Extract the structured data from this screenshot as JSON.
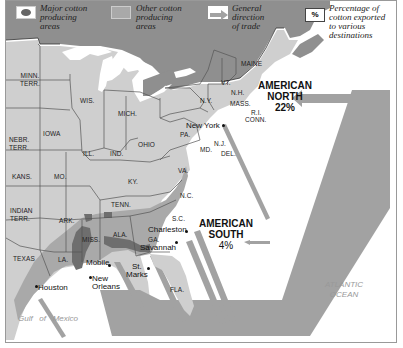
{
  "legend": {
    "major": {
      "icon": "major-cotton-swatch",
      "label_lines": [
        "Major cotton",
        "producing",
        "areas"
      ]
    },
    "other": {
      "icon": "other-cotton-swatch",
      "label_lines": [
        "Other cotton",
        "producing",
        "areas"
      ]
    },
    "trade": {
      "icon": "arrow-right-icon",
      "label_lines": [
        "General",
        "direction",
        "of trade"
      ]
    },
    "percent": {
      "icon_text": "%",
      "label_lines": [
        "Percentage of",
        "cotton exported",
        "to various",
        "destinations"
      ]
    }
  },
  "colors": {
    "canada": "#8f8f8f",
    "states": "#cfcfcf",
    "other_cotton": "#a9a9a9",
    "major_cotton": "#6e6e6e",
    "trade_band": "#a2a2a2",
    "water": "#ffffff",
    "borders": "#555555"
  },
  "states": [
    {
      "name": "MINN.",
      "name2": "TERR."
    },
    {
      "name": "WIS."
    },
    {
      "name": "MICH."
    },
    {
      "name": "IOWA"
    },
    {
      "name": "NEBR.",
      "name2": "TERR."
    },
    {
      "name": "ILL."
    },
    {
      "name": "IND."
    },
    {
      "name": "OHIO"
    },
    {
      "name": "PA."
    },
    {
      "name": "N.Y."
    },
    {
      "name": "VT."
    },
    {
      "name": "N.H."
    },
    {
      "name": "MAINE"
    },
    {
      "name": "MASS."
    },
    {
      "name": "R.I."
    },
    {
      "name": "CONN."
    },
    {
      "name": "N.J."
    },
    {
      "name": "MD."
    },
    {
      "name": "DEL."
    },
    {
      "name": "KANS."
    },
    {
      "name": "MO."
    },
    {
      "name": "KY."
    },
    {
      "name": "VA."
    },
    {
      "name": "INDIAN",
      "name2": "TERR."
    },
    {
      "name": "TENN."
    },
    {
      "name": "N.C."
    },
    {
      "name": "ARK."
    },
    {
      "name": "S.C."
    },
    {
      "name": "MISS."
    },
    {
      "name": "ALA."
    },
    {
      "name": "GA."
    },
    {
      "name": "TEXAS"
    },
    {
      "name": "LA."
    },
    {
      "name": "FLA."
    }
  ],
  "cities": [
    {
      "name": "New York"
    },
    {
      "name": "Charleston"
    },
    {
      "name": "Savannah"
    },
    {
      "name": "Mobile"
    },
    {
      "name": "New",
      "name2": "Orleans"
    },
    {
      "name": "St.",
      "name2": "Marks"
    },
    {
      "name": "Houston"
    }
  ],
  "destinations": {
    "north": {
      "lines": [
        "AMERICAN",
        "NORTH"
      ],
      "percent": "22%"
    },
    "south": {
      "lines": [
        "AMERICAN",
        "SOUTH"
      ],
      "percent": "4%"
    }
  },
  "water_labels": {
    "gulf": "Gulf   of   Mexico",
    "atlantic": [
      "ATLANTIC",
      "OCEAN"
    ]
  }
}
